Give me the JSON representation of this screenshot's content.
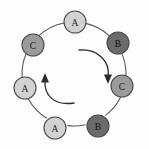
{
  "figure": {
    "background_color": "#fdfdfd",
    "edge_color": "#5a5a5a",
    "node_stroke_color": "#4a4a4a"
  },
  "legend_colors": {
    "light_gray": "#d2d2d2",
    "medium_gray": "#9b9b9b",
    "dark_gray": "#6b6b6b"
  },
  "chart_data": {
    "type": "diagram",
    "title": "",
    "layout": "ring",
    "node_count": 7,
    "center": {
      "x": 74,
      "y": 74
    },
    "ring_radius": 52,
    "node_radius": 11,
    "nodes": [
      {
        "id": "n0",
        "label": "A",
        "shade": "light",
        "color": "#d2d2d2",
        "x": 75,
        "y": 22,
        "r": 11,
        "angle_deg": 270
      },
      {
        "id": "n1",
        "label": "B",
        "shade": "dark",
        "color": "#6b6b6b",
        "x": 118,
        "y": 43,
        "r": 11,
        "angle_deg": 323
      },
      {
        "id": "n2",
        "label": "C",
        "shade": "medium",
        "color": "#9b9b9b",
        "x": 122,
        "y": 86,
        "r": 11,
        "angle_deg": 13
      },
      {
        "id": "n3",
        "label": "B",
        "shade": "dark",
        "color": "#6b6b6b",
        "x": 98,
        "y": 126,
        "r": 11,
        "angle_deg": 64
      },
      {
        "id": "n4",
        "label": "A",
        "shade": "light",
        "color": "#d2d2d2",
        "x": 55,
        "y": 128,
        "r": 11,
        "angle_deg": 110
      },
      {
        "id": "n5",
        "label": "A",
        "shade": "light",
        "color": "#d2d2d2",
        "x": 25,
        "y": 88,
        "r": 11,
        "angle_deg": 166
      },
      {
        "id": "n6",
        "label": "C",
        "shade": "medium",
        "color": "#9b9b9b",
        "x": 33,
        "y": 45,
        "r": 11,
        "angle_deg": 215
      }
    ],
    "edges": [
      {
        "from": "n0",
        "to": "n1"
      },
      {
        "from": "n1",
        "to": "n2"
      },
      {
        "from": "n2",
        "to": "n3"
      },
      {
        "from": "n3",
        "to": "n4"
      },
      {
        "from": "n4",
        "to": "n5"
      },
      {
        "from": "n5",
        "to": "n6"
      },
      {
        "from": "n6",
        "to": "n0"
      }
    ],
    "rotation_arrows": [
      {
        "id": "arrow-right",
        "direction": "clockwise",
        "path": "M 79 50 C 98 48 110 62 108 76",
        "head_points": "108,84 104.0,74.5 112.0,74.5",
        "head_rotation_deg": 0
      },
      {
        "id": "arrow-left",
        "direction": "clockwise",
        "path": "M 74 103 C 54 106 44 95 45 81",
        "head_points": "45,73 41.0,82.5 49.0,82.5",
        "head_rotation_deg": 180
      }
    ],
    "node_label_sequence": [
      "A",
      "B",
      "C",
      "B",
      "A",
      "A",
      "C"
    ]
  }
}
